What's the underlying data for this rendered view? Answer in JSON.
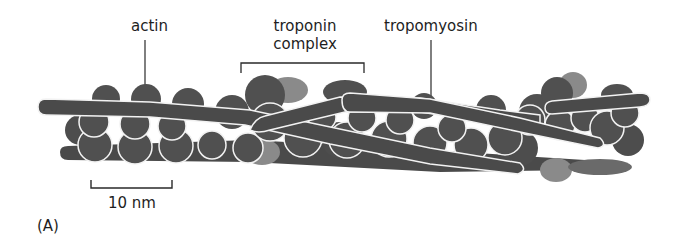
{
  "figure": {
    "panel_label": "(A)",
    "labels": {
      "actin": "actin",
      "troponin_line1": "troponin",
      "troponin_line2": "complex",
      "tropomyosin": "tropomyosin"
    },
    "scale_bar": {
      "label": "10 nm"
    },
    "colors": {
      "filament": "#4a4a4a",
      "actin_monomer": "#505050",
      "troponin": "#8a8a8a",
      "outline": "#f2f2f2",
      "text": "#1e1e1e",
      "background": "#ffffff"
    }
  }
}
